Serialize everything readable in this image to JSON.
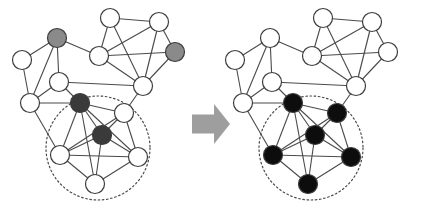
{
  "figure": {
    "width": 426,
    "height": 208,
    "background_color": "#ffffff"
  },
  "style": {
    "node_fill_white": "#ffffff",
    "node_fill_gray": "#8a8a8a",
    "node_fill_dark": "#3a3a3a",
    "node_fill_black": "#0d0d0d",
    "node_stroke": "#3c3c3c",
    "node_stroke_width": 1.2,
    "node_radius": 9.5,
    "edge_color": "#4a4a4a",
    "edge_width": 1.1,
    "cluster_circle_color": "#4a4a4a",
    "cluster_circle_dash": "1.6 2.6",
    "cluster_circle_width": 1.2,
    "arrow_fill": "#9e9e9e"
  },
  "arrow": {
    "name": "transformation-arrow",
    "label": "transforms into",
    "direction": "right",
    "x": 192,
    "y": 104,
    "width": 38,
    "height": 40,
    "color": "#9e9e9e"
  },
  "panels": [
    {
      "id": "before",
      "name": "graph-before",
      "label": "Before",
      "cluster": {
        "cx": 98,
        "cy": 148,
        "r": 52
      },
      "nodes": [
        {
          "id": "a1",
          "x": 57,
          "y": 38,
          "state": "gray",
          "in_cluster": false
        },
        {
          "id": "a2",
          "x": 22,
          "y": 60,
          "state": "white",
          "in_cluster": false
        },
        {
          "id": "a3",
          "x": 59,
          "y": 82,
          "state": "white",
          "in_cluster": false
        },
        {
          "id": "a4",
          "x": 30,
          "y": 103,
          "state": "white",
          "in_cluster": false
        },
        {
          "id": "a5",
          "x": 110,
          "y": 18,
          "state": "white",
          "in_cluster": false
        },
        {
          "id": "a6",
          "x": 99,
          "y": 56,
          "state": "white",
          "in_cluster": false
        },
        {
          "id": "a7",
          "x": 159,
          "y": 22,
          "state": "white",
          "in_cluster": false
        },
        {
          "id": "a8",
          "x": 175,
          "y": 52,
          "state": "gray",
          "in_cluster": false
        },
        {
          "id": "a9",
          "x": 143,
          "y": 86,
          "state": "white",
          "in_cluster": false
        },
        {
          "id": "b1",
          "x": 80,
          "y": 103,
          "state": "dark",
          "in_cluster": true
        },
        {
          "id": "b2",
          "x": 124,
          "y": 113,
          "state": "white",
          "in_cluster": true
        },
        {
          "id": "b3",
          "x": 102,
          "y": 135,
          "state": "dark",
          "in_cluster": true
        },
        {
          "id": "b4",
          "x": 60,
          "y": 155,
          "state": "white",
          "in_cluster": true
        },
        {
          "id": "b5",
          "x": 138,
          "y": 157,
          "state": "white",
          "in_cluster": true
        },
        {
          "id": "b6",
          "x": 95,
          "y": 184,
          "state": "white",
          "in_cluster": true
        }
      ],
      "edges": [
        [
          "a1",
          "a2"
        ],
        [
          "a1",
          "a3"
        ],
        [
          "a1",
          "a4"
        ],
        [
          "a1",
          "a6"
        ],
        [
          "a2",
          "a4"
        ],
        [
          "a3",
          "a4"
        ],
        [
          "a3",
          "b1"
        ],
        [
          "a3",
          "a9"
        ],
        [
          "a4",
          "b4"
        ],
        [
          "a4",
          "b1"
        ],
        [
          "a5",
          "a6"
        ],
        [
          "a5",
          "a7"
        ],
        [
          "a5",
          "a9"
        ],
        [
          "a6",
          "a7"
        ],
        [
          "a6",
          "a9"
        ],
        [
          "a7",
          "a8"
        ],
        [
          "a7",
          "a9"
        ],
        [
          "a8",
          "a6"
        ],
        [
          "a8",
          "a9"
        ],
        [
          "a9",
          "b2"
        ],
        [
          "b1",
          "b2"
        ],
        [
          "b1",
          "b3"
        ],
        [
          "b1",
          "b4"
        ],
        [
          "b1",
          "b5"
        ],
        [
          "b1",
          "b6"
        ],
        [
          "b2",
          "b3"
        ],
        [
          "b2",
          "b4"
        ],
        [
          "b2",
          "b5"
        ],
        [
          "b3",
          "b4"
        ],
        [
          "b3",
          "b5"
        ],
        [
          "b3",
          "b6"
        ],
        [
          "b4",
          "b5"
        ],
        [
          "b4",
          "b6"
        ],
        [
          "b5",
          "b6"
        ]
      ]
    },
    {
      "id": "after",
      "name": "graph-after",
      "label": "After",
      "cluster": {
        "cx": 311,
        "cy": 148,
        "r": 52
      },
      "nodes": [
        {
          "id": "c1",
          "x": 270,
          "y": 38,
          "state": "white",
          "in_cluster": false
        },
        {
          "id": "c2",
          "x": 235,
          "y": 60,
          "state": "white",
          "in_cluster": false
        },
        {
          "id": "c3",
          "x": 272,
          "y": 82,
          "state": "white",
          "in_cluster": false
        },
        {
          "id": "c4",
          "x": 243,
          "y": 103,
          "state": "white",
          "in_cluster": false
        },
        {
          "id": "c5",
          "x": 323,
          "y": 18,
          "state": "white",
          "in_cluster": false
        },
        {
          "id": "c6",
          "x": 312,
          "y": 56,
          "state": "white",
          "in_cluster": false
        },
        {
          "id": "c7",
          "x": 372,
          "y": 22,
          "state": "white",
          "in_cluster": false
        },
        {
          "id": "c8",
          "x": 388,
          "y": 52,
          "state": "white",
          "in_cluster": false
        },
        {
          "id": "c9",
          "x": 356,
          "y": 86,
          "state": "white",
          "in_cluster": false
        },
        {
          "id": "d1",
          "x": 293,
          "y": 103,
          "state": "black",
          "in_cluster": true
        },
        {
          "id": "d2",
          "x": 337,
          "y": 113,
          "state": "black",
          "in_cluster": true
        },
        {
          "id": "d3",
          "x": 315,
          "y": 135,
          "state": "black",
          "in_cluster": true
        },
        {
          "id": "d4",
          "x": 273,
          "y": 155,
          "state": "black",
          "in_cluster": true
        },
        {
          "id": "d5",
          "x": 351,
          "y": 157,
          "state": "black",
          "in_cluster": true
        },
        {
          "id": "d6",
          "x": 308,
          "y": 184,
          "state": "black",
          "in_cluster": true
        }
      ],
      "edges": [
        [
          "c1",
          "c2"
        ],
        [
          "c1",
          "c3"
        ],
        [
          "c1",
          "c4"
        ],
        [
          "c1",
          "c6"
        ],
        [
          "c2",
          "c4"
        ],
        [
          "c3",
          "c4"
        ],
        [
          "c3",
          "d1"
        ],
        [
          "c3",
          "c9"
        ],
        [
          "c4",
          "d4"
        ],
        [
          "c4",
          "d1"
        ],
        [
          "c5",
          "c6"
        ],
        [
          "c5",
          "c7"
        ],
        [
          "c5",
          "c9"
        ],
        [
          "c6",
          "c7"
        ],
        [
          "c6",
          "c9"
        ],
        [
          "c7",
          "c8"
        ],
        [
          "c7",
          "c9"
        ],
        [
          "c8",
          "c6"
        ],
        [
          "c8",
          "c9"
        ],
        [
          "c9",
          "d2"
        ],
        [
          "d1",
          "d2"
        ],
        [
          "d1",
          "d3"
        ],
        [
          "d1",
          "d4"
        ],
        [
          "d1",
          "d5"
        ],
        [
          "d1",
          "d6"
        ],
        [
          "d2",
          "d3"
        ],
        [
          "d2",
          "d4"
        ],
        [
          "d2",
          "d5"
        ],
        [
          "d3",
          "d4"
        ],
        [
          "d3",
          "d5"
        ],
        [
          "d3",
          "d6"
        ],
        [
          "d4",
          "d5"
        ],
        [
          "d4",
          "d6"
        ],
        [
          "d5",
          "d6"
        ]
      ]
    }
  ]
}
